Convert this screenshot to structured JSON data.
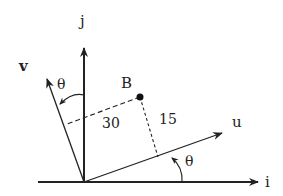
{
  "diagram": {
    "axes": {
      "i_label": "i",
      "j_label": "j"
    },
    "vectors": {
      "u_label": "u",
      "v_label": "v"
    },
    "point": {
      "label": "B"
    },
    "distances": {
      "to_v": "30",
      "to_u": "15"
    },
    "angles": {
      "v_angle": "θ",
      "u_angle": "θ"
    },
    "colors": {
      "line": "#222222",
      "background": "#ffffff"
    }
  }
}
